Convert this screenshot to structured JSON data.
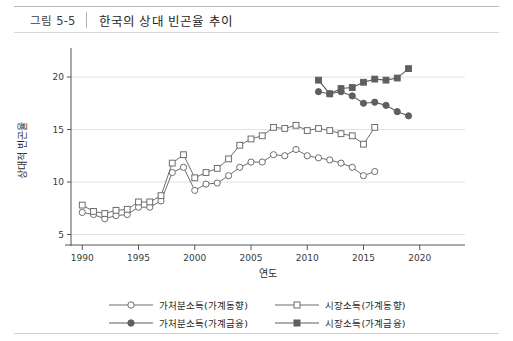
{
  "header": {
    "figure_number": "그림 5-5",
    "title": "한국의 상대 빈곤율 추이"
  },
  "legend": {
    "items": [
      {
        "label": "가처분소득(가계동향)",
        "marker": "open-circle-icon",
        "color": "#6d6d6d"
      },
      {
        "label": "시장소득(가계동향)",
        "marker": "open-square-icon",
        "color": "#6d6d6d"
      },
      {
        "label": "가처분소득(가계금융)",
        "marker": "filled-circle-icon",
        "color": "#5f5f5f"
      },
      {
        "label": "시장소득(가계금융)",
        "marker": "filled-square-icon",
        "color": "#5f5f5f"
      }
    ]
  },
  "axes": {
    "x_label": "연도",
    "y_label": "상대적 빈곤율",
    "x_ticks": [
      "1990",
      "1995",
      "2000",
      "2005",
      "2010",
      "2015",
      "2020"
    ],
    "y_ticks": [
      "5",
      "10",
      "15",
      "20"
    ]
  },
  "chart_data": {
    "type": "line",
    "title": "한국의 상대 빈곤율 추이",
    "xlabel": "연도",
    "ylabel": "상대적 빈곤율",
    "xlim": [
      1989,
      2021
    ],
    "ylim": [
      4,
      22
    ],
    "xtick_values": [
      1990,
      1995,
      2000,
      2005,
      2010,
      2015,
      2020
    ],
    "ytick_values": [
      5,
      10,
      15,
      20
    ],
    "grid": "horizontal",
    "legend_position": "bottom",
    "series": [
      {
        "name": "가처분소득(가계동향)",
        "marker": "open-circle",
        "color": "#6d6d6d",
        "x": [
          1990,
          1991,
          1992,
          1993,
          1994,
          1995,
          1996,
          1997,
          1998,
          1999,
          2000,
          2001,
          2002,
          2003,
          2004,
          2005,
          2006,
          2007,
          2008,
          2009,
          2010,
          2011,
          2012,
          2013,
          2014,
          2015,
          2016
        ],
        "y": [
          7.1,
          6.9,
          6.5,
          6.8,
          6.9,
          7.6,
          7.6,
          8.2,
          10.9,
          11.4,
          9.2,
          9.8,
          9.9,
          10.6,
          11.4,
          11.9,
          11.9,
          12.6,
          12.5,
          13.1,
          12.5,
          12.3,
          12.1,
          11.8,
          11.4,
          10.6,
          11.0
        ]
      },
      {
        "name": "시장소득(가계동향)",
        "marker": "open-square",
        "color": "#6d6d6d",
        "x": [
          1990,
          1991,
          1992,
          1993,
          1994,
          1995,
          1996,
          1997,
          1998,
          1999,
          2000,
          2001,
          2002,
          2003,
          2004,
          2005,
          2006,
          2007,
          2008,
          2009,
          2010,
          2011,
          2012,
          2013,
          2014,
          2015,
          2016
        ],
        "y": [
          7.8,
          7.2,
          7.0,
          7.3,
          7.4,
          8.1,
          8.1,
          8.7,
          11.8,
          12.6,
          10.4,
          10.9,
          11.3,
          12.2,
          13.5,
          14.1,
          14.4,
          15.2,
          15.1,
          15.4,
          14.9,
          15.1,
          14.9,
          14.6,
          14.4,
          13.6,
          15.2
        ]
      },
      {
        "name": "가처분소득(가계금융)",
        "marker": "filled-circle",
        "color": "#5f5f5f",
        "x": [
          2011,
          2012,
          2013,
          2014,
          2015,
          2016,
          2017,
          2018,
          2019
        ],
        "y": [
          18.6,
          18.4,
          18.6,
          18.2,
          17.5,
          17.6,
          17.3,
          16.7,
          16.3
        ]
      },
      {
        "name": "시장소득(가계금융)",
        "marker": "filled-square",
        "color": "#5f5f5f",
        "x": [
          2011,
          2012,
          2013,
          2014,
          2015,
          2016,
          2017,
          2018,
          2019
        ],
        "y": [
          19.7,
          18.4,
          18.9,
          19.0,
          19.5,
          19.8,
          19.7,
          19.9,
          20.8
        ]
      }
    ]
  }
}
